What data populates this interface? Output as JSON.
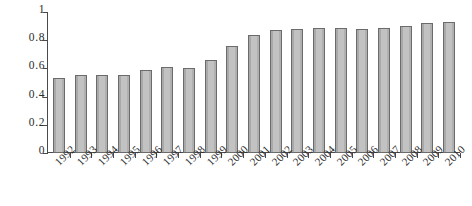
{
  "chart_data": {
    "type": "bar",
    "title": "",
    "subtitle": "",
    "xlabel": "",
    "ylabel": "",
    "ylim": [
      0,
      1
    ],
    "yticks": [
      "0",
      "0.2",
      "0.4",
      "0.6",
      "0.8",
      "1"
    ],
    "ytick_values": [
      0,
      0.2,
      0.4,
      0.6,
      0.8,
      1
    ],
    "grid": false,
    "legend": false,
    "legend_position": "none",
    "bar_color": "#b9b9b9",
    "bar_border_color": "#6b6b6b",
    "axis_color": "#4a4a4a",
    "background_color": "#ffffff",
    "categories": [
      "1992",
      "1993",
      "1994",
      "1995",
      "1996",
      "1997",
      "1998",
      "1999",
      "2000",
      "2001",
      "2002",
      "2003",
      "2004",
      "2005",
      "2006",
      "2007",
      "2008",
      "2009",
      "2010"
    ],
    "values": [
      0.53,
      0.55,
      0.55,
      0.55,
      0.59,
      0.61,
      0.6,
      0.66,
      0.76,
      0.84,
      0.87,
      0.88,
      0.89,
      0.89,
      0.88,
      0.89,
      0.9,
      0.92,
      0.93
    ]
  }
}
